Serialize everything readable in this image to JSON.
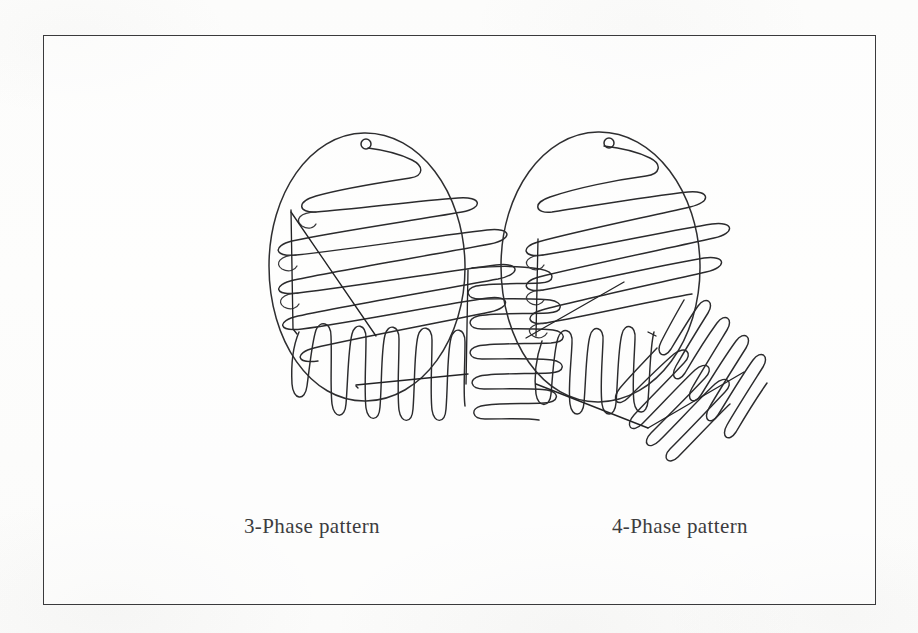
{
  "figure": {
    "background_color": "#fdfdfc",
    "frame_color": "#3a3a3c",
    "ink_color": "#2b2b2d",
    "caption_left": "3-Phase pattern",
    "caption_right": "4-Phase pattern"
  },
  "plates": [
    {
      "id": "three-phase",
      "label": "3-Phase pattern",
      "phase_count": 3,
      "center_x": 268,
      "center_y": 265,
      "radius": 133,
      "inoculation_start": {
        "x": 265,
        "y": 143,
        "marker": "loop-dot",
        "radius": 5
      },
      "phases": [
        {
          "index": 1,
          "name": "primary-streak",
          "region": "upper",
          "stroke_angle_deg": -12,
          "stroke_count": 9,
          "orientation": "diagonal-shallow"
        },
        {
          "index": 2,
          "name": "secondary-streak",
          "region": "lower-left",
          "stroke_angle_deg": 90,
          "stroke_count": 11,
          "orientation": "vertical"
        },
        {
          "index": 3,
          "name": "tertiary-streak",
          "region": "right",
          "stroke_angle_deg": 0,
          "stroke_count": 9,
          "orientation": "horizontal"
        }
      ]
    },
    {
      "id": "four-phase",
      "label": "4-Phase pattern",
      "phase_count": 4,
      "center_x": 636,
      "center_y": 265,
      "radius": 136,
      "inoculation_start": {
        "x": 650,
        "y": 142,
        "marker": "loop-dot",
        "radius": 5
      },
      "phases": [
        {
          "index": 1,
          "name": "primary-streak",
          "region": "upper",
          "stroke_angle_deg": -14,
          "stroke_count": 8,
          "orientation": "diagonal-shallow"
        },
        {
          "index": 2,
          "name": "secondary-streak",
          "region": "left",
          "stroke_angle_deg": 80,
          "stroke_count": 8,
          "orientation": "near-vertical"
        },
        {
          "index": 3,
          "name": "tertiary-streak",
          "region": "lower-centre",
          "stroke_angle_deg": -30,
          "stroke_count": 9,
          "orientation": "diagonal-rising"
        },
        {
          "index": 4,
          "name": "quaternary-streak",
          "region": "right",
          "stroke_angle_deg": -62,
          "stroke_count": 10,
          "orientation": "diagonal-steep"
        }
      ]
    }
  ]
}
